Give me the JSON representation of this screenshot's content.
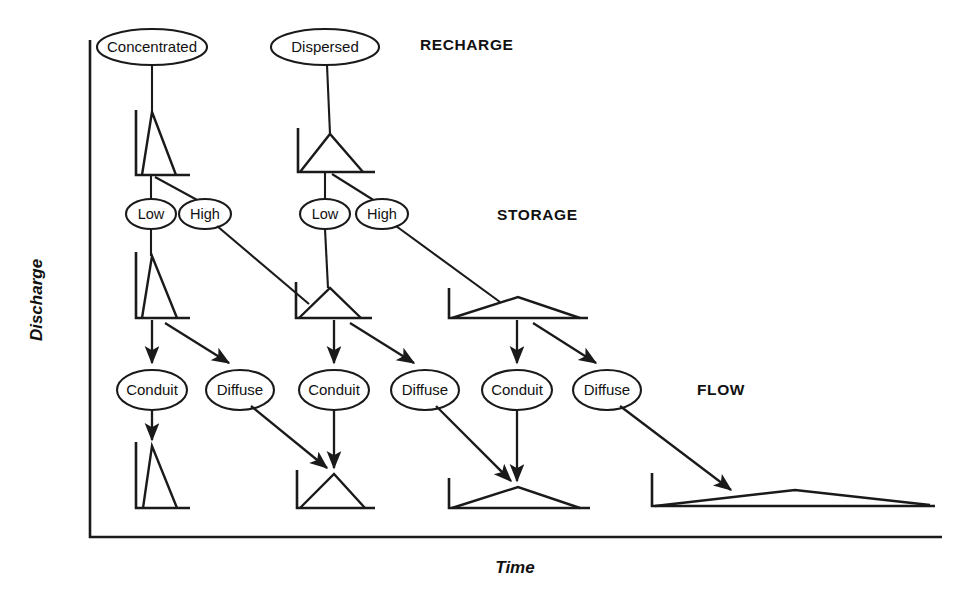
{
  "figure": {
    "axes": {
      "y_label": "Discharge",
      "x_label": "Time"
    },
    "stage_labels": [
      {
        "id": "recharge",
        "text": "RECHARGE",
        "x": 420,
        "y": 50
      },
      {
        "id": "storage",
        "text": "STORAGE",
        "x": 497,
        "y": 215
      },
      {
        "id": "flow",
        "text": "FLOW",
        "x": 697,
        "y": 390
      }
    ],
    "nodes": [
      {
        "id": "concentrated",
        "label": "Concentrated",
        "cx": 152,
        "cy": 47,
        "rx": 55,
        "ry": 18
      },
      {
        "id": "dispersed",
        "label": "Dispersed",
        "cx": 325,
        "cy": 47,
        "rx": 54,
        "ry": 18
      },
      {
        "id": "low-1",
        "label": "Low",
        "cx": 151,
        "cy": 214,
        "rx": 25,
        "ry": 15
      },
      {
        "id": "high-1",
        "label": "High",
        "cx": 205,
        "cy": 214,
        "rx": 26,
        "ry": 15
      },
      {
        "id": "low-2",
        "label": "Low",
        "cx": 325,
        "cy": 214,
        "rx": 25,
        "ry": 15
      },
      {
        "id": "high-2",
        "label": "High",
        "cx": 382,
        "cy": 214,
        "rx": 26,
        "ry": 15
      },
      {
        "id": "conduit-1",
        "label": "Conduit",
        "cx": 152,
        "cy": 390,
        "rx": 35,
        "ry": 20
      },
      {
        "id": "diffuse-1",
        "label": "Diffuse",
        "cx": 240,
        "cy": 390,
        "rx": 34,
        "ry": 20
      },
      {
        "id": "conduit-2",
        "label": "Conduit",
        "cx": 334,
        "cy": 390,
        "rx": 35,
        "ry": 20
      },
      {
        "id": "diffuse-2",
        "label": "Diffuse",
        "cx": 425,
        "cy": 390,
        "rx": 34,
        "ry": 20
      },
      {
        "id": "conduit-3",
        "label": "Conduit",
        "cx": 517,
        "cy": 390,
        "rx": 35,
        "ry": 20
      },
      {
        "id": "diffuse-3",
        "label": "Diffuse",
        "cx": 607,
        "cy": 390,
        "rx": 34,
        "ry": 20
      }
    ],
    "hydrographs": [
      {
        "id": "hydro-recharge-concentrated",
        "stage": "recharge",
        "shape": "sharp-narrow-peak",
        "axis": "M 136,110 L 136,175 L 190,175",
        "curve": "M 142,175 L 152,112 L 176,175"
      },
      {
        "id": "hydro-recharge-dispersed",
        "stage": "recharge",
        "shape": "broad-symmetric-peak",
        "axis": "M 298,128 L 298,172 L 375,172",
        "curve": "M 300,172 L 330,134 L 363,172"
      },
      {
        "id": "hydro-storage-low-concentrated",
        "stage": "storage",
        "shape": "sharp-narrow-peak",
        "axis": "M 136,252 L 136,318 L 190,318",
        "curve": "M 142,318 L 152,256 L 177,318"
      },
      {
        "id": "hydro-storage-high-concentrated",
        "stage": "storage",
        "shape": "broad-symmetric-peak",
        "axis": "M 296,282 L 296,318 L 372,318",
        "curve": "M 299,318 L 330,288 L 361,318"
      },
      {
        "id": "hydro-storage-high-dispersed",
        "stage": "storage",
        "shape": "very-broad-low-peak",
        "axis": "M 449,288 L 449,318 L 588,318",
        "curve": "M 452,318 L 518,297 L 580,318"
      },
      {
        "id": "hydro-flow-conduit-1",
        "stage": "flow",
        "shape": "sharp-narrow-peak",
        "axis": "M 136,442 L 136,508 L 190,508",
        "curve": "M 143,508 L 152,446 L 177,508"
      },
      {
        "id": "hydro-flow-conduit-2",
        "stage": "flow",
        "shape": "broad-symmetric-peak",
        "axis": "M 297,470 L 297,508 L 375,508",
        "curve": "M 300,508 L 334,474 L 365,508"
      },
      {
        "id": "hydro-flow-conduit-3",
        "stage": "flow",
        "shape": "very-broad-low-peak",
        "axis": "M 449,478 L 449,508 L 590,508",
        "curve": "M 452,508 L 518,487 L 580,508"
      },
      {
        "id": "hydro-flow-diffuse-3",
        "stage": "flow",
        "shape": "extremely-broad-flat-peak",
        "axis": "M 652,473 L 652,506 L 935,506",
        "curve": "M 655,506 L 795,490 L 930,505"
      }
    ],
    "connectors": [
      {
        "id": "concentrated-to-hydro1",
        "type": "line",
        "from": "concentrated",
        "to": "hydro-recharge-concentrated"
      },
      {
        "id": "dispersed-to-hydro2",
        "type": "line",
        "from": "dispersed",
        "to": "hydro-recharge-dispersed"
      },
      {
        "id": "hydro1-to-low1",
        "type": "line",
        "from": "hydro-recharge-concentrated",
        "to": "low-1"
      },
      {
        "id": "hydro1-to-high1",
        "type": "line",
        "from": "hydro-recharge-concentrated",
        "to": "high-1"
      },
      {
        "id": "hydro2-to-low2",
        "type": "line",
        "from": "hydro-recharge-dispersed",
        "to": "low-2"
      },
      {
        "id": "hydro2-to-high2",
        "type": "line",
        "from": "hydro-recharge-dispersed",
        "to": "high-2"
      },
      {
        "id": "low1-to-storage1",
        "type": "line",
        "from": "low-1",
        "to": "hydro-storage-low-concentrated"
      },
      {
        "id": "high1-to-storage2",
        "type": "line",
        "from": "high-1",
        "to": "hydro-storage-high-concentrated"
      },
      {
        "id": "low2-to-storage2",
        "type": "line",
        "from": "low-2",
        "to": "hydro-storage-high-concentrated"
      },
      {
        "id": "high2-to-storage3",
        "type": "line",
        "from": "high-2",
        "to": "hydro-storage-high-dispersed"
      },
      {
        "id": "storage1-to-conduit1",
        "type": "arrow",
        "from": "hydro-storage-low-concentrated",
        "to": "conduit-1"
      },
      {
        "id": "storage1-to-diffuse1",
        "type": "arrow",
        "from": "hydro-storage-low-concentrated",
        "to": "diffuse-1"
      },
      {
        "id": "storage2-to-conduit2",
        "type": "arrow",
        "from": "hydro-storage-high-concentrated",
        "to": "conduit-2"
      },
      {
        "id": "storage2-to-diffuse2",
        "type": "arrow",
        "from": "hydro-storage-high-concentrated",
        "to": "diffuse-2"
      },
      {
        "id": "storage3-to-conduit3",
        "type": "arrow",
        "from": "hydro-storage-high-dispersed",
        "to": "conduit-3"
      },
      {
        "id": "storage3-to-diffuse3",
        "type": "arrow",
        "from": "hydro-storage-high-dispersed",
        "to": "diffuse-3"
      },
      {
        "id": "conduit1-to-flow1",
        "type": "arrow",
        "from": "conduit-1",
        "to": "hydro-flow-conduit-1"
      },
      {
        "id": "diffuse1-to-flow2",
        "type": "arrow",
        "from": "diffuse-1",
        "to": "hydro-flow-conduit-2"
      },
      {
        "id": "conduit2-to-flow2",
        "type": "arrow",
        "from": "conduit-2",
        "to": "hydro-flow-conduit-2"
      },
      {
        "id": "diffuse2-to-flow3",
        "type": "arrow",
        "from": "diffuse-2",
        "to": "hydro-flow-conduit-3"
      },
      {
        "id": "conduit3-to-flow3",
        "type": "arrow",
        "from": "conduit-3",
        "to": "hydro-flow-conduit-3"
      },
      {
        "id": "diffuse3-to-flow4",
        "type": "arrow",
        "from": "diffuse-3",
        "to": "hydro-flow-diffuse-3"
      }
    ],
    "colors": {
      "ink": "#1a1a1a",
      "background": "#ffffff"
    }
  }
}
